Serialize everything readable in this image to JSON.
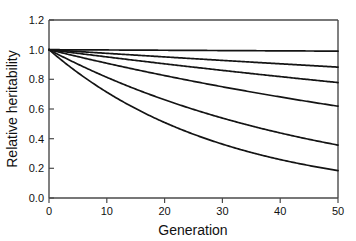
{
  "chart_data": {
    "type": "line",
    "title": "",
    "xlabel": "Generation",
    "ylabel": "Relative heritability",
    "xlim": [
      0,
      50
    ],
    "ylim": [
      0.0,
      1.2
    ],
    "grid": false,
    "legend": "none",
    "xticks": [
      0,
      10,
      20,
      30,
      40,
      50
    ],
    "xtick_labels": [
      "0",
      "10",
      "20",
      "30",
      "40",
      "50"
    ],
    "yticks": [
      0.0,
      0.2,
      0.4,
      0.6,
      0.8,
      1.0,
      1.2
    ],
    "ytick_labels": [
      "0.0",
      "0.2",
      "0.4",
      "0.6",
      "0.8",
      "1.0",
      "1.2"
    ],
    "x": [
      0,
      5,
      10,
      15,
      20,
      25,
      30,
      35,
      40,
      45,
      50
    ],
    "series": [
      {
        "name": "curve-1",
        "decay_rate": 0.0002,
        "values": [
          1.0,
          0.999,
          0.998,
          0.997,
          0.996,
          0.995,
          0.994,
          0.993,
          0.992,
          0.991,
          0.99
        ]
      },
      {
        "name": "curve-2",
        "decay_rate": 0.0025,
        "values": [
          1.0,
          0.9876,
          0.9753,
          0.9632,
          0.9512,
          0.9394,
          0.9277,
          0.9162,
          0.9048,
          0.8936,
          0.8825
        ]
      },
      {
        "name": "curve-3",
        "decay_rate": 0.005,
        "values": [
          1.0,
          0.9753,
          0.9511,
          0.9276,
          0.9046,
          0.8821,
          0.8602,
          0.8389,
          0.818,
          0.7977,
          0.7778
        ]
      },
      {
        "name": "curve-4",
        "decay_rate": 0.00955,
        "values": [
          1.0,
          0.9531,
          0.9084,
          0.8658,
          0.8252,
          0.7865,
          0.7496,
          0.7145,
          0.681,
          0.649,
          0.6186
        ]
      },
      {
        "name": "curve-5",
        "decay_rate": 0.0204,
        "values": [
          1.0,
          0.9021,
          0.8138,
          0.7341,
          0.6622,
          0.5974,
          0.5389,
          0.4861,
          0.4385,
          0.3956,
          0.3569
        ]
      },
      {
        "name": "curve-6",
        "decay_rate": 0.0332,
        "values": [
          1.0,
          0.8446,
          0.7133,
          0.6024,
          0.5088,
          0.4297,
          0.3629,
          0.3065,
          0.2589,
          0.2186,
          0.1846
        ]
      }
    ]
  },
  "axes": {
    "x_title": "Generation",
    "y_title": "Relative heritability"
  }
}
